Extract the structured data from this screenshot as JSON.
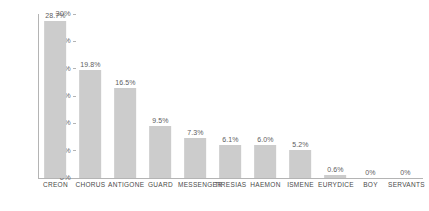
{
  "chart_data": {
    "type": "bar",
    "title": "",
    "subtitle": "",
    "xlabel": "",
    "ylabel": "",
    "ylim": [
      0,
      30
    ],
    "grid": false,
    "legend": null,
    "orientation": "vertical",
    "bar_color": "#cccccc",
    "axis_color": "#b4b4b4",
    "label_color": "#5d5d5d",
    "tick_color": "#6b6b6b",
    "categories": [
      "CREON",
      "CHORUS",
      "ANTIGONE",
      "GUARD",
      "MESSENGER",
      "TIRESIAS",
      "HAEMON",
      "ISMENE",
      "EURYDICE",
      "BOY",
      "SERVANTS"
    ],
    "values": [
      28.7,
      19.8,
      16.5,
      9.5,
      7.3,
      6.1,
      6.0,
      5.2,
      0.6,
      0,
      0
    ],
    "value_labels": [
      "28.7%",
      "19.8%",
      "16.5%",
      "9.5%",
      "7.3%",
      "6.1%",
      "6.0%",
      "5.2%",
      "0.6%",
      "0%",
      "0%"
    ],
    "yticks": [
      0,
      5,
      10,
      15,
      20,
      25,
      30
    ],
    "ytick_labels": [
      "0%",
      "5%",
      "10%",
      "15%",
      "20%",
      "25%",
      "30%"
    ]
  }
}
